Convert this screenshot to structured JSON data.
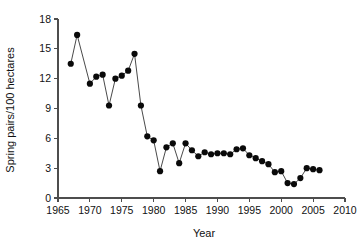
{
  "chart_data": {
    "type": "line",
    "title": "",
    "subtitle": "",
    "xlabel": "Year",
    "ylabel": "Spring pairs/100 hectares",
    "xlim": [
      1965,
      2010
    ],
    "ylim": [
      0,
      18
    ],
    "xticks": [
      1965,
      1970,
      1975,
      1980,
      1985,
      1990,
      1995,
      2000,
      2005,
      2010
    ],
    "yticks": [
      0,
      3,
      6,
      9,
      12,
      15,
      18
    ],
    "grid": false,
    "legend": null,
    "marker": "filled-circle",
    "line_style": "solid",
    "series": [
      {
        "name": "Spring pairs per 100 hectares",
        "x": [
          1967,
          1968,
          1970,
          1971,
          1972,
          1973,
          1974,
          1975,
          1976,
          1977,
          1978,
          1979,
          1980,
          1981,
          1982,
          1983,
          1984,
          1985,
          1986,
          1987,
          1988,
          1989,
          1990,
          1991,
          1992,
          1993,
          1994,
          1995,
          1996,
          1997,
          1998,
          1999,
          2000,
          2001,
          2002,
          2003,
          2004,
          2005,
          2006
        ],
        "values": [
          13.5,
          16.4,
          11.5,
          12.2,
          12.4,
          9.3,
          12.0,
          12.3,
          12.8,
          14.5,
          9.3,
          6.2,
          5.8,
          2.7,
          5.1,
          5.5,
          3.5,
          5.5,
          4.8,
          4.2,
          4.6,
          4.4,
          4.5,
          4.5,
          4.4,
          4.9,
          5.0,
          4.3,
          4.0,
          3.7,
          3.4,
          2.6,
          2.7,
          1.5,
          1.4,
          2.0,
          3.0,
          2.9,
          2.8
        ]
      }
    ]
  },
  "axes": {
    "x_tick_labels": [
      "1965",
      "1970",
      "1975",
      "1980",
      "1985",
      "1990",
      "1995",
      "2000",
      "2005",
      "2010"
    ],
    "y_tick_labels": [
      "0",
      "3",
      "6",
      "9",
      "12",
      "15",
      "18"
    ],
    "x_axis_title": "Year",
    "y_axis_title": "Spring pairs/100 hectares"
  },
  "colors": {
    "line": "#4a4a4a",
    "marker": "#0a0a0a",
    "axis": "#4d4d4d",
    "text": "#111111",
    "background": "#ffffff"
  }
}
